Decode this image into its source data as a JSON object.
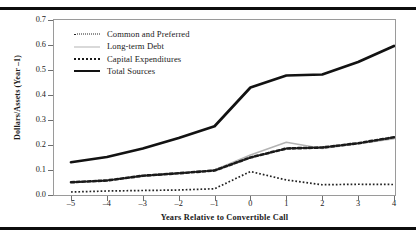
{
  "figure": {
    "top_rule": true,
    "bottom_rule": true
  },
  "chart_data": {
    "type": "line",
    "title": "",
    "xlabel": "Years Relative to Convertible Call",
    "ylabel": "Dollars/Assets (Year –1)",
    "x": [
      -5,
      -4,
      -3,
      -2,
      -1,
      0,
      1,
      2,
      3,
      4
    ],
    "xtick_labels": [
      "–5",
      "–4",
      "–3",
      "–2",
      "–1",
      "0",
      "1",
      "2",
      "3",
      "4"
    ],
    "ytick_labels": [
      "0.0",
      "0.1",
      "0.2",
      "0.3",
      "0.4",
      "0.5",
      "0.6",
      "0.7"
    ],
    "ytick_values": [
      0.0,
      0.1,
      0.2,
      0.3,
      0.4,
      0.5,
      0.6,
      0.7
    ],
    "xlim": [
      -5,
      4
    ],
    "ylim": [
      0.0,
      0.7
    ],
    "grid": false,
    "legend_position": "upper left",
    "series": [
      {
        "name": "Common and Preferred",
        "style": "fine-dotted",
        "color": "#222222",
        "width": 1.7,
        "values": [
          0.012,
          0.016,
          0.018,
          0.02,
          0.025,
          0.094,
          0.06,
          0.041,
          0.043,
          0.042
        ]
      },
      {
        "name": "Long-term Debt",
        "style": "thin-solid",
        "color": "#b3b3b3",
        "width": 1.5,
        "values": [
          0.05,
          0.057,
          0.075,
          0.086,
          0.1,
          0.16,
          0.211,
          0.186,
          0.205,
          0.225
        ]
      },
      {
        "name": "Capital Expenditures",
        "style": "heavy-dashed",
        "color": "#1a1a1a",
        "width": 2.6,
        "values": [
          0.051,
          0.058,
          0.077,
          0.087,
          0.098,
          0.15,
          0.186,
          0.19,
          0.207,
          0.231
        ]
      },
      {
        "name": "Total Sources",
        "style": "heavy-solid",
        "color": "#121212",
        "width": 2.7,
        "values": [
          0.131,
          0.152,
          0.186,
          0.228,
          0.275,
          0.43,
          0.478,
          0.482,
          0.532,
          0.596
        ]
      }
    ]
  }
}
